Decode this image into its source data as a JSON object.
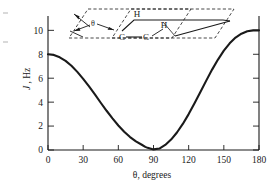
{
  "figure": {
    "name": "karplus-curve-figure",
    "background_color": "#ffffff",
    "line_color": "#1a1a1a"
  },
  "chart_data": {
    "type": "line",
    "title": "",
    "xlabel": "θ, degrees",
    "ylabel": "J, Hz",
    "ylabel_italic_part": "J",
    "ylabel_rest_part": ", Hz",
    "xlim": [
      0,
      180
    ],
    "ylim": [
      0,
      11.2
    ],
    "grid": false,
    "legend": null,
    "xticks": [
      0,
      30,
      60,
      90,
      120,
      150,
      180
    ],
    "xticklabels": [
      "0",
      "30",
      "60",
      "90",
      "120",
      "150",
      "180"
    ],
    "yticks": [
      0,
      2,
      4,
      6,
      8,
      10
    ],
    "yticklabels": [
      "0",
      "2",
      "4",
      "6",
      "8",
      "10"
    ],
    "series": [
      {
        "name": "Karplus relationship",
        "x": [
          0,
          5,
          10,
          15,
          20,
          25,
          30,
          35,
          40,
          45,
          50,
          55,
          60,
          65,
          70,
          75,
          80,
          83,
          85,
          90,
          95,
          100,
          105,
          110,
          115,
          120,
          125,
          130,
          135,
          140,
          145,
          150,
          155,
          160,
          165,
          170,
          175,
          180
        ],
        "values": [
          8.0,
          7.94,
          7.75,
          7.45,
          7.04,
          6.53,
          5.95,
          5.31,
          4.64,
          3.95,
          3.28,
          2.64,
          2.05,
          1.53,
          1.08,
          0.72,
          0.44,
          0.26,
          0.18,
          0.05,
          0.12,
          0.42,
          0.87,
          1.46,
          2.18,
          3.0,
          3.9,
          4.84,
          5.8,
          6.72,
          7.56,
          8.3,
          8.92,
          9.4,
          9.72,
          9.92,
          10.0,
          10.0
        ]
      }
    ]
  },
  "inset": {
    "name": "dihedral-angle-diagram",
    "description": "Newman-style H-C-C-H dihedral angle diagram with two dashed planes",
    "atoms": [
      {
        "id": "h-top",
        "label": "H"
      },
      {
        "id": "h-right",
        "label": "H"
      },
      {
        "id": "c-left",
        "label": "C"
      },
      {
        "id": "c-right",
        "label": "C"
      }
    ],
    "angle_label": "θ"
  }
}
